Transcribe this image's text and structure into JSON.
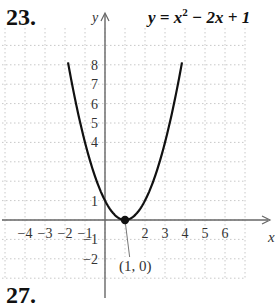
{
  "problem": {
    "number": "23.",
    "next_number": "27."
  },
  "chart_data": {
    "type": "line",
    "equation": {
      "lhs": "y",
      "base": "x",
      "exp": "2",
      "rest": "− 2x + 1"
    },
    "xlabel": "x",
    "ylabel": "y",
    "xlim": [
      -5,
      8
    ],
    "ylim": [
      -3,
      9.5
    ],
    "x_ticks": [
      -4,
      -3,
      -2,
      -1,
      2,
      3,
      4,
      5,
      6
    ],
    "y_ticks": [
      8,
      7,
      6,
      5,
      4,
      1,
      -1,
      -2
    ],
    "grid": true,
    "series": [
      {
        "name": "y = x^2 - 2x + 1",
        "x": [
          -2,
          -1,
          0,
          1,
          2,
          3,
          4
        ],
        "y": [
          9,
          4,
          1,
          0,
          1,
          4,
          9
        ]
      }
    ],
    "annotations": [
      {
        "point": [
          1,
          0
        ],
        "label": "(1, 0)"
      }
    ]
  }
}
